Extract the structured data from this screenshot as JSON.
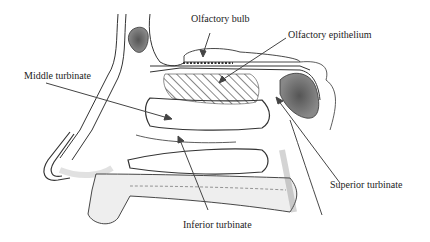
{
  "diagram": {
    "labels": {
      "olfactory_bulb": "Olfactory bulb",
      "olfactory_epithelium": "Olfactory epithelium",
      "middle_turbinate": "Middle turbinate",
      "superior_turbinate": "Superior turbinate",
      "inferior_turbinate": "Inferior turbinate"
    },
    "colors": {
      "ink": "#333333",
      "shading": "#9a9a9a",
      "background": "#ffffff"
    }
  }
}
